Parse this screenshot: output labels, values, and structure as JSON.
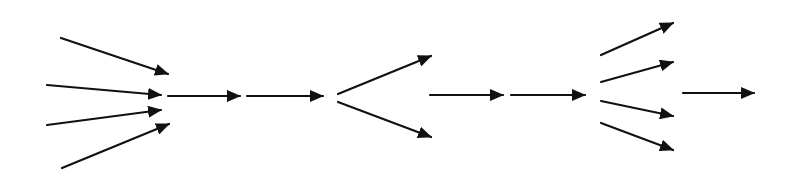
{
  "diagram": {
    "type": "arrow-flow",
    "background": "#ffffff",
    "stroke_color": "#111111",
    "stroke_width": 2.2,
    "stages": [
      {
        "name": "converge-4",
        "arrows": [
          {
            "x1": 61,
            "y1": 38,
            "x2": 168,
            "y2": 74
          },
          {
            "x1": 47,
            "y1": 85,
            "x2": 161,
            "y2": 95
          },
          {
            "x1": 47,
            "y1": 125,
            "x2": 161,
            "y2": 110
          },
          {
            "x1": 62,
            "y1": 168,
            "x2": 169,
            "y2": 124
          }
        ]
      },
      {
        "name": "straight-1",
        "arrows": [
          {
            "x1": 168,
            "y1": 96,
            "x2": 240,
            "y2": 96
          }
        ]
      },
      {
        "name": "straight-2",
        "arrows": [
          {
            "x1": 247,
            "y1": 96,
            "x2": 323,
            "y2": 96
          }
        ]
      },
      {
        "name": "diverge-2",
        "arrows": [
          {
            "x1": 338,
            "y1": 94,
            "x2": 431,
            "y2": 56
          },
          {
            "x1": 338,
            "y1": 102,
            "x2": 431,
            "y2": 137
          }
        ]
      },
      {
        "name": "straight-3",
        "arrows": [
          {
            "x1": 430,
            "y1": 95,
            "x2": 503,
            "y2": 95
          }
        ]
      },
      {
        "name": "straight-4",
        "arrows": [
          {
            "x1": 511,
            "y1": 95,
            "x2": 585,
            "y2": 95
          }
        ]
      },
      {
        "name": "diverge-4",
        "arrows": [
          {
            "x1": 601,
            "y1": 55,
            "x2": 673,
            "y2": 23
          },
          {
            "x1": 601,
            "y1": 82,
            "x2": 673,
            "y2": 62
          },
          {
            "x1": 601,
            "y1": 101,
            "x2": 673,
            "y2": 116
          },
          {
            "x1": 601,
            "y1": 123,
            "x2": 673,
            "y2": 150
          }
        ]
      },
      {
        "name": "straight-5",
        "arrows": [
          {
            "x1": 683,
            "y1": 93,
            "x2": 754,
            "y2": 93
          }
        ]
      }
    ]
  }
}
